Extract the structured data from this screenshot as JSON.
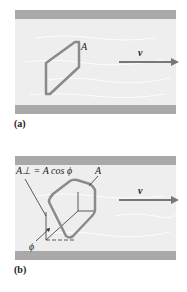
{
  "figure": {
    "panels": [
      {
        "id": "a",
        "label": "(a)",
        "area_label": "A",
        "velocity_label": "v⃗"
      },
      {
        "id": "b",
        "label": "(b)",
        "area_label": "A",
        "perp_area_label": "A⊥ = A cos ϕ",
        "angle_label": "ϕ",
        "velocity_label": "v⃗"
      }
    ],
    "colors": {
      "wall": "#a9a9a9",
      "fluid": "#eeeeee",
      "loop": "#8a8a8a",
      "arrow": "#777777",
      "text": "#222222"
    }
  }
}
